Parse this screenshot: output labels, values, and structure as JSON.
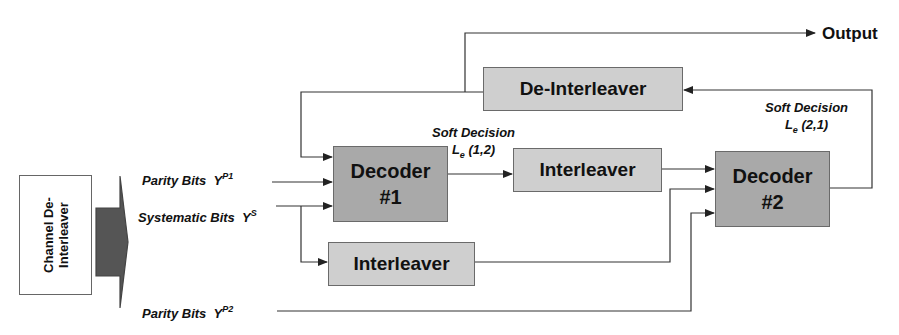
{
  "channel_deinterleaver": {
    "line1": "Channel De-",
    "line2": "Interleaver"
  },
  "inputs": {
    "parity1": {
      "text": "Parity Bits",
      "symbol": "Y",
      "sup": "P1"
    },
    "systematic": {
      "text": "Systematic Bits",
      "symbol": "Y",
      "sup": "S"
    },
    "parity2": {
      "text": "Parity Bits",
      "symbol": "Y",
      "sup": "P2"
    }
  },
  "blocks": {
    "decoder1": {
      "line1": "Decoder",
      "line2": "#1"
    },
    "decoder2": {
      "line1": "Decoder",
      "line2": "#2"
    },
    "interleaver_upper": "Interleaver",
    "interleaver_lower": "Interleaver",
    "deinterleaver": "De-Interleaver"
  },
  "soft_decisions": {
    "le12": {
      "title": "Soft Decision",
      "L": "L",
      "sub": "e",
      "args": "(1,2)"
    },
    "le21": {
      "title": "Soft Decision",
      "L": "L",
      "sub": "e",
      "args": "(2,1)"
    }
  },
  "output": "Output",
  "colors": {
    "decoder_fill": "#a9a9a9",
    "interleaver_fill": "#cfcfcf",
    "line": "#333333",
    "arrow_fill": "#555555"
  }
}
